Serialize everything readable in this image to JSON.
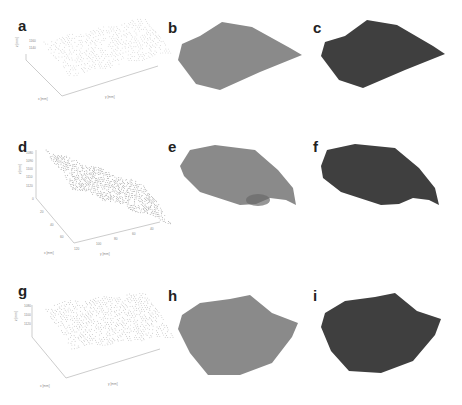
{
  "figure": {
    "panels": [
      {
        "id": "a",
        "label": "a",
        "type": "3d-scatter",
        "x": 0,
        "y": 0
      },
      {
        "id": "b",
        "label": "b",
        "type": "surface",
        "shade": "#8a8a8a",
        "x": 160,
        "y": 0
      },
      {
        "id": "c",
        "label": "c",
        "type": "surface",
        "shade": "#3f3f3f",
        "x": 305,
        "y": 0
      },
      {
        "id": "d",
        "label": "d",
        "type": "3d-scatter",
        "x": 0,
        "y": 130
      },
      {
        "id": "e",
        "label": "e",
        "type": "surface",
        "shade": "#8a8a8a",
        "x": 160,
        "y": 130
      },
      {
        "id": "f",
        "label": "f",
        "type": "surface",
        "shade": "#3f3f3f",
        "x": 305,
        "y": 130
      },
      {
        "id": "g",
        "label": "g",
        "type": "3d-scatter",
        "x": 0,
        "y": 265
      },
      {
        "id": "h",
        "label": "h",
        "type": "surface",
        "shade": "#8a8a8a",
        "x": 160,
        "y": 265
      },
      {
        "id": "i",
        "label": "i",
        "type": "surface",
        "shade": "#3f3f3f",
        "x": 305,
        "y": 265
      }
    ],
    "axes": {
      "a": {
        "zlabel": "z [mm]",
        "xlabel": "x [mm]",
        "ylabel": "y [mm]",
        "zticks": [
          "1160",
          "1140"
        ],
        "xticks": [
          "0",
          "20",
          "40",
          "60",
          "80"
        ],
        "yticks": [
          "120",
          "100",
          "80",
          "60",
          "40",
          "20"
        ]
      },
      "d": {
        "zlabel": "z [mm]",
        "xlabel": "x [mm]",
        "ylabel": "y [mm]",
        "zticks": [
          "1080",
          "1090",
          "1100",
          "1110",
          "1120"
        ],
        "xticks": [
          "0",
          "20",
          "40",
          "60"
        ],
        "yticks": [
          "120",
          "100",
          "80",
          "60",
          "40"
        ]
      },
      "g": {
        "zlabel": "z [mm]",
        "xlabel": "x [mm]",
        "ylabel": "y [mm]",
        "zticks": [
          "1080",
          "1100",
          "1120"
        ],
        "xticks": [
          "0",
          "20",
          "40",
          "60",
          "80"
        ],
        "yticks": [
          "120",
          "100",
          "80",
          "60",
          "40",
          "20"
        ]
      }
    }
  },
  "chart_data": [
    {
      "type": "scatter",
      "title": "a",
      "xlabel": "x [mm]",
      "ylabel": "y [mm]",
      "zlabel": "z [mm]",
      "note": "3D point cloud of surface scan"
    },
    {
      "type": "scatter",
      "title": "d",
      "xlabel": "x [mm]",
      "ylabel": "y [mm]",
      "zlabel": "z [mm]",
      "zlim": [
        1080,
        1120
      ],
      "note": "3D point cloud of surface scan"
    },
    {
      "type": "scatter",
      "title": "g",
      "xlabel": "x [mm]",
      "ylabel": "y [mm]",
      "zlabel": "z [mm]",
      "note": "3D point cloud of surface scan"
    }
  ]
}
